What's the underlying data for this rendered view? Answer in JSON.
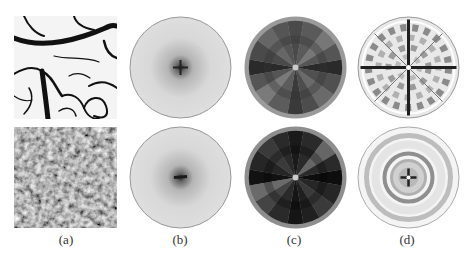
{
  "figure": {
    "subfigures": [
      {
        "id": "a",
        "label": "(a)",
        "description": "Texture images: top = dark vein-like line texture on white, bottom = noisy gray random texture"
      },
      {
        "id": "b",
        "label": "(b)",
        "description": "Fourier power spectra: light gray disks with dark center"
      },
      {
        "id": "c",
        "label": "(c)",
        "description": "Polar sector-quantized spectra: dark wedges with lighter outer ring"
      },
      {
        "id": "d",
        "label": "(d)",
        "description": "Ring/wedge feature maps: light disks with gray ring and spoke patterns"
      }
    ],
    "rows": [
      "top",
      "bottom"
    ]
  },
  "colors": {
    "background": "#ffffff",
    "texture_dark": "#111111",
    "spectrum_light": "#d6d6d6",
    "spectrum_center": "#2a2a2a",
    "sector_ring": "#9a9a9a",
    "sector_dark": "#2b2b2b",
    "ring_gray": "#a8a8a8"
  }
}
